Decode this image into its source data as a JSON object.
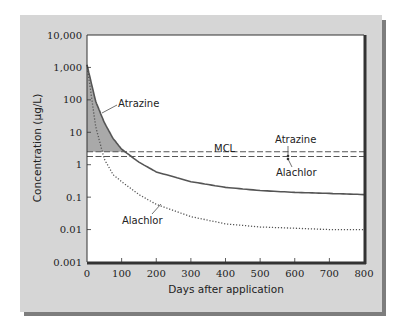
{
  "chart_data": {
    "type": "line",
    "title": "",
    "xlabel": "Days after application",
    "ylabel": "Concentration (μg/L)",
    "xlim": [
      0,
      800
    ],
    "ylim": [
      0.001,
      10000
    ],
    "yscale": "log",
    "grid": false,
    "x_ticks": [
      "0",
      "100",
      "200",
      "300",
      "400",
      "500",
      "600",
      "700",
      "800"
    ],
    "y_ticks": [
      "10,000",
      "1,000",
      "100",
      "10",
      "1",
      "0.1",
      "0.01",
      "0.001"
    ],
    "series": [
      {
        "name": "Atrazine",
        "style": "solid",
        "x": [
          0,
          25,
          50,
          75,
          100,
          150,
          200,
          300,
          400,
          500,
          600,
          700,
          800
        ],
        "y": [
          1200,
          90,
          20,
          6.5,
          3,
          1.2,
          0.6,
          0.3,
          0.2,
          0.16,
          0.14,
          0.13,
          0.12
        ]
      },
      {
        "name": "Alachlor",
        "style": "dotted",
        "x": [
          0,
          25,
          50,
          75,
          100,
          150,
          200,
          300,
          400,
          500,
          600,
          700,
          800
        ],
        "y": [
          1200,
          15,
          1.5,
          0.5,
          0.3,
          0.12,
          0.06,
          0.025,
          0.015,
          0.012,
          0.011,
          0.01,
          0.01
        ]
      }
    ],
    "reference_lines": [
      {
        "name": "MCL Atrazine",
        "y": 2.5,
        "style": "dashed"
      },
      {
        "name": "MCL Alachlor",
        "y": 1.8,
        "style": "dashed"
      }
    ],
    "shaded_region": "Area between Atrazine curve and MCL line from 0 to ~170 days",
    "annotations": [
      {
        "text": "Atrazine",
        "target": "Atrazine curve"
      },
      {
        "text": "Alachlor",
        "target": "Alachlor curve"
      },
      {
        "text": "MCL",
        "target": "MCL lines"
      },
      {
        "text": "Atrazine",
        "target": "upper MCL line"
      },
      {
        "text": "Alachlor",
        "target": "lower MCL line"
      }
    ],
    "legend": "none (inline annotations)"
  },
  "labels": {
    "xlabel": "Days after application",
    "ylabel": "Concentration (μg/L)",
    "curve_atrazine": "Atrazine",
    "curve_alachlor": "Alachlor",
    "mcl": "MCL",
    "mcl_atrazine": "Atrazine",
    "mcl_alachlor": "Alachlor"
  },
  "x_ticks": [
    "0",
    "100",
    "200",
    "300",
    "400",
    "500",
    "600",
    "700",
    "800"
  ],
  "y_ticks": [
    "10,000",
    "1,000",
    "100",
    "10",
    "1",
    "0.1",
    "0.01",
    "0.001"
  ]
}
